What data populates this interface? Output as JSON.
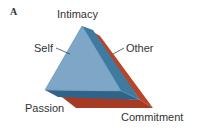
{
  "panel_label": "A",
  "vertices": {
    "top": "Intimacy",
    "bottom_left": "Passion",
    "bottom_right": "Commitment"
  },
  "layers": {
    "front": "Self",
    "back": "Other"
  },
  "colors": {
    "front_face": "#7ea6c6",
    "blue_edge": "#3f7aa0",
    "blue_edge_dark": "#2f6489",
    "red_back": "#b8452a",
    "red_back_dark": "#9a3520",
    "text": "#333333"
  }
}
